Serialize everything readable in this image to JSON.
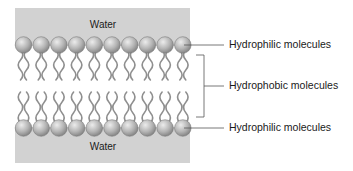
{
  "diagram": {
    "water_top": {
      "label": "Water"
    },
    "water_bottom": {
      "label": "Water"
    },
    "labels": {
      "top_hydrophilic": "Hydrophilic molecules",
      "hydrophobic": "Hydrophobic molecules",
      "bottom_hydrophilic": "Hydrophilic molecules"
    },
    "heads_per_row": 10,
    "colors": {
      "water": "#d2d2d2",
      "head_light": "#e6e6e6",
      "head_dark": "#7d7d7d",
      "tail": "#8f8f8f",
      "leader_line": "#555555"
    }
  }
}
